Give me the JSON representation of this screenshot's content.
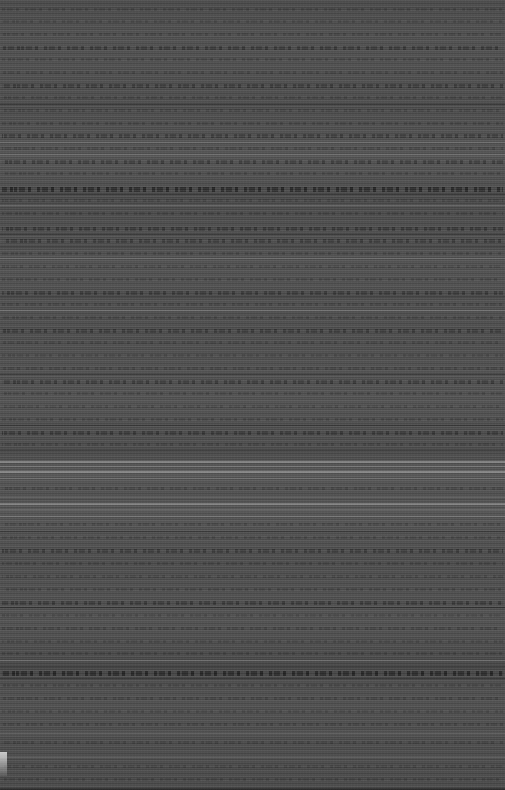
{
  "capture": {
    "width": 505,
    "height": 790,
    "condition": "corrupted",
    "artifact_type": "horizontal-scanline-noise",
    "legible_text": "none",
    "background_color": "#4e4e4e",
    "darkest_tone": "#2e2e2e",
    "brightest_tone": "#d8d8d8"
  },
  "layout": {
    "content_left_edge": 2,
    "content_right_edge": 503,
    "has_margins": false,
    "has_columns": false,
    "line_pitch": 12
  },
  "text_bands": [
    {
      "y": 8,
      "h": 3,
      "weight": "weak"
    },
    {
      "y": 20,
      "h": 3,
      "weight": "weak"
    },
    {
      "y": 33,
      "h": 3,
      "weight": "weak"
    },
    {
      "y": 46,
      "h": 4,
      "weight": "mid"
    },
    {
      "y": 58,
      "h": 3,
      "weight": "weak"
    },
    {
      "y": 71,
      "h": 3,
      "weight": "weak"
    },
    {
      "y": 84,
      "h": 4,
      "weight": "mid"
    },
    {
      "y": 96,
      "h": 3,
      "weight": "weak"
    },
    {
      "y": 109,
      "h": 3,
      "weight": "weak"
    },
    {
      "y": 122,
      "h": 3,
      "weight": "weak"
    },
    {
      "y": 134,
      "h": 4,
      "weight": "mid"
    },
    {
      "y": 147,
      "h": 3,
      "weight": "weak"
    },
    {
      "y": 160,
      "h": 4,
      "weight": "mid"
    },
    {
      "y": 172,
      "h": 3,
      "weight": "weak"
    },
    {
      "y": 187,
      "h": 5,
      "weight": "heavy"
    },
    {
      "y": 199,
      "h": 3,
      "weight": "weak"
    },
    {
      "y": 212,
      "h": 3,
      "weight": "weak"
    },
    {
      "y": 227,
      "h": 4,
      "weight": "mid"
    },
    {
      "y": 239,
      "h": 4,
      "weight": "mid"
    },
    {
      "y": 252,
      "h": 3,
      "weight": "weak"
    },
    {
      "y": 265,
      "h": 3,
      "weight": "weak"
    },
    {
      "y": 278,
      "h": 3,
      "weight": "weak"
    },
    {
      "y": 291,
      "h": 4,
      "weight": "mid"
    },
    {
      "y": 303,
      "h": 3,
      "weight": "weak"
    },
    {
      "y": 316,
      "h": 3,
      "weight": "weak"
    },
    {
      "y": 329,
      "h": 4,
      "weight": "mid"
    },
    {
      "y": 341,
      "h": 3,
      "weight": "weak"
    },
    {
      "y": 354,
      "h": 3,
      "weight": "weak"
    },
    {
      "y": 367,
      "h": 3,
      "weight": "weak"
    },
    {
      "y": 380,
      "h": 4,
      "weight": "mid"
    },
    {
      "y": 392,
      "h": 3,
      "weight": "weak"
    },
    {
      "y": 405,
      "h": 3,
      "weight": "weak"
    },
    {
      "y": 418,
      "h": 3,
      "weight": "weak"
    },
    {
      "y": 431,
      "h": 4,
      "weight": "mid"
    },
    {
      "y": 443,
      "h": 3,
      "weight": "weak"
    },
    {
      "y": 487,
      "h": 3,
      "weight": "weak"
    },
    {
      "y": 523,
      "h": 3,
      "weight": "weak"
    },
    {
      "y": 536,
      "h": 3,
      "weight": "weak"
    },
    {
      "y": 549,
      "h": 4,
      "weight": "mid"
    },
    {
      "y": 562,
      "h": 3,
      "weight": "weak"
    },
    {
      "y": 575,
      "h": 3,
      "weight": "weak"
    },
    {
      "y": 588,
      "h": 3,
      "weight": "weak"
    },
    {
      "y": 601,
      "h": 4,
      "weight": "mid"
    },
    {
      "y": 614,
      "h": 3,
      "weight": "weak"
    },
    {
      "y": 627,
      "h": 3,
      "weight": "weak"
    },
    {
      "y": 640,
      "h": 3,
      "weight": "weak"
    },
    {
      "y": 652,
      "h": 3,
      "weight": "weak"
    },
    {
      "y": 671,
      "h": 5,
      "weight": "heavy"
    },
    {
      "y": 684,
      "h": 3,
      "weight": "weak"
    },
    {
      "y": 697,
      "h": 3,
      "weight": "weak"
    },
    {
      "y": 710,
      "h": 3,
      "weight": "weak"
    },
    {
      "y": 723,
      "h": 3,
      "weight": "weak"
    },
    {
      "y": 741,
      "h": 3,
      "weight": "weak"
    },
    {
      "y": 765,
      "h": 3,
      "weight": "weak"
    },
    {
      "y": 778,
      "h": 3,
      "weight": "weak"
    }
  ],
  "bright_rules": [
    {
      "y": 142,
      "h": 1,
      "soft": true
    },
    {
      "y": 154,
      "h": 1,
      "soft": true
    },
    {
      "y": 205,
      "h": 1,
      "soft": true
    },
    {
      "y": 258,
      "h": 1,
      "soft": true
    },
    {
      "y": 310,
      "h": 1,
      "soft": true
    },
    {
      "y": 461,
      "h": 2,
      "soft": false
    },
    {
      "y": 466,
      "h": 1,
      "soft": true
    },
    {
      "y": 471,
      "h": 2,
      "soft": false
    },
    {
      "y": 478,
      "h": 1,
      "soft": true
    },
    {
      "y": 497,
      "h": 1,
      "soft": true
    },
    {
      "y": 503,
      "h": 2,
      "soft": false
    },
    {
      "y": 509,
      "h": 1,
      "soft": true
    },
    {
      "y": 516,
      "h": 1,
      "soft": true
    },
    {
      "y": 660,
      "h": 1,
      "soft": true
    },
    {
      "y": 733,
      "h": 1,
      "soft": true
    },
    {
      "y": 757,
      "h": 1,
      "soft": true
    }
  ],
  "dark_rules": [
    {
      "y": 104,
      "h": 1
    },
    {
      "y": 194,
      "h": 1
    },
    {
      "y": 234,
      "h": 1
    },
    {
      "y": 246,
      "h": 1
    },
    {
      "y": 296,
      "h": 1
    },
    {
      "y": 374,
      "h": 1
    },
    {
      "y": 425,
      "h": 1
    },
    {
      "y": 450,
      "h": 1
    },
    {
      "y": 531,
      "h": 1
    },
    {
      "y": 607,
      "h": 1
    },
    {
      "y": 666,
      "h": 1
    },
    {
      "y": 678,
      "h": 1
    },
    {
      "y": 788,
      "h": 2
    }
  ],
  "corner_artifact": {
    "x": 0,
    "y": 752,
    "width": 7,
    "height": 24
  }
}
